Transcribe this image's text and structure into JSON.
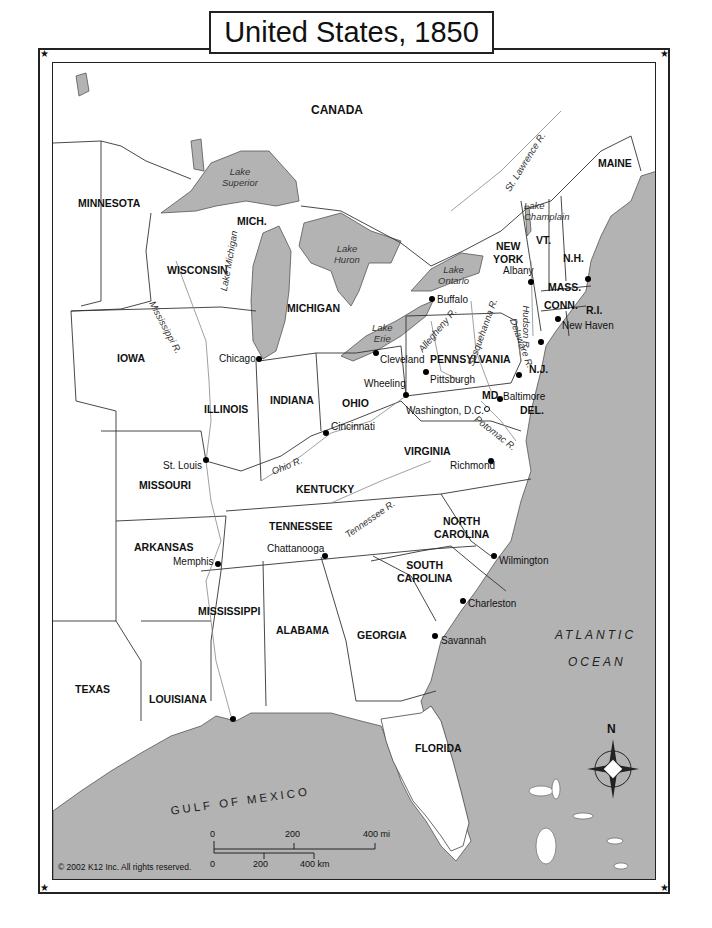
{
  "title": "United States, 1850",
  "colors": {
    "water": "#b3b3b3",
    "land": "#ffffff",
    "border": "#222222"
  },
  "regions": {
    "canada": "CANADA",
    "states": [
      {
        "id": "minnesota",
        "label": "MINNESOTA"
      },
      {
        "id": "wisconsin",
        "label": "WISCONSIN"
      },
      {
        "id": "mich-up",
        "label": "MICH."
      },
      {
        "id": "michigan",
        "label": "MICHIGAN"
      },
      {
        "id": "iowa",
        "label": "IOWA"
      },
      {
        "id": "illinois",
        "label": "ILLINOIS"
      },
      {
        "id": "indiana",
        "label": "INDIANA"
      },
      {
        "id": "ohio",
        "label": "OHIO"
      },
      {
        "id": "missouri",
        "label": "MISSOURI"
      },
      {
        "id": "kentucky",
        "label": "KENTUCKY"
      },
      {
        "id": "tennessee",
        "label": "TENNESSEE"
      },
      {
        "id": "arkansas",
        "label": "ARKANSAS"
      },
      {
        "id": "mississippi",
        "label": "MISSISSIPPI"
      },
      {
        "id": "alabama",
        "label": "ALABAMA"
      },
      {
        "id": "georgia",
        "label": "GEORGIA"
      },
      {
        "id": "florida",
        "label": "FLORIDA"
      },
      {
        "id": "texas",
        "label": "TEXAS"
      },
      {
        "id": "louisiana",
        "label": "LOUISIANA"
      },
      {
        "id": "south-carolina",
        "label": "SOUTH\nCAROLINA"
      },
      {
        "id": "north-carolina",
        "label": "NORTH\nCAROLINA"
      },
      {
        "id": "virginia",
        "label": "VIRGINIA"
      },
      {
        "id": "pennsylvania",
        "label": "PENNSYLVANIA"
      },
      {
        "id": "new-york",
        "label": "NEW\nYORK"
      },
      {
        "id": "vermont",
        "label": "VT."
      },
      {
        "id": "new-hampshire",
        "label": "N.H."
      },
      {
        "id": "maine",
        "label": "MAINE"
      },
      {
        "id": "massachusetts",
        "label": "MASS."
      },
      {
        "id": "connecticut",
        "label": "CONN."
      },
      {
        "id": "rhode-island",
        "label": "R.I."
      },
      {
        "id": "new-jersey",
        "label": "N.J."
      },
      {
        "id": "maryland",
        "label": "MD."
      },
      {
        "id": "delaware",
        "label": "DEL."
      }
    ]
  },
  "lakes": [
    {
      "id": "superior",
      "label": "Lake\nSuperior"
    },
    {
      "id": "michigan",
      "label": "Lake Michigan"
    },
    {
      "id": "huron",
      "label": "Lake\nHuron"
    },
    {
      "id": "erie",
      "label": "Lake\nErie"
    },
    {
      "id": "ontario",
      "label": "Lake\nOntario"
    },
    {
      "id": "champlain",
      "label": "Lake\nChamplain"
    }
  ],
  "rivers": [
    {
      "id": "st-lawrence",
      "label": "St. Lawrence R."
    },
    {
      "id": "mississippi",
      "label": "Mississippi R."
    },
    {
      "id": "ohio",
      "label": "Ohio R."
    },
    {
      "id": "tennessee",
      "label": "Tennessee R."
    },
    {
      "id": "allegheny",
      "label": "Allegheny R."
    },
    {
      "id": "susquehanna",
      "label": "Susquehanna R."
    },
    {
      "id": "delaware",
      "label": "Delaware R."
    },
    {
      "id": "hudson",
      "label": "Hudson R."
    },
    {
      "id": "potomac",
      "label": "Potomac R."
    }
  ],
  "cities": [
    {
      "id": "chicago",
      "label": "Chicago"
    },
    {
      "id": "buffalo",
      "label": "Buffalo"
    },
    {
      "id": "albany",
      "label": "Albany"
    },
    {
      "id": "new-haven",
      "label": "New Haven"
    },
    {
      "id": "cleveland",
      "label": "Cleveland"
    },
    {
      "id": "pittsburgh",
      "label": "Pittsburgh"
    },
    {
      "id": "wheeling",
      "label": "Wheeling"
    },
    {
      "id": "baltimore",
      "label": "Baltimore"
    },
    {
      "id": "washington",
      "label": "Washington, D.C."
    },
    {
      "id": "cincinnati",
      "label": "Cincinnati"
    },
    {
      "id": "st-louis",
      "label": "St. Louis"
    },
    {
      "id": "richmond",
      "label": "Richmond"
    },
    {
      "id": "memphis",
      "label": "Memphis"
    },
    {
      "id": "chattanooga",
      "label": "Chattanooga"
    },
    {
      "id": "wilmington",
      "label": "Wilmington"
    },
    {
      "id": "charleston",
      "label": "Charleston"
    },
    {
      "id": "savannah",
      "label": "Savannah"
    }
  ],
  "water_bodies": {
    "atlantic_1": "ATLANTIC",
    "atlantic_2": "OCEAN",
    "gulf": "GULF OF MEXICO"
  },
  "compass": {
    "north_label": "N"
  },
  "scale": {
    "mi_ticks": [
      "0",
      "200",
      "400 mi"
    ],
    "km_ticks": [
      "0",
      "200",
      "400 km"
    ]
  },
  "copyright": "© 2002 K12 Inc. All rights reserved.",
  "corner_glyph": "★"
}
